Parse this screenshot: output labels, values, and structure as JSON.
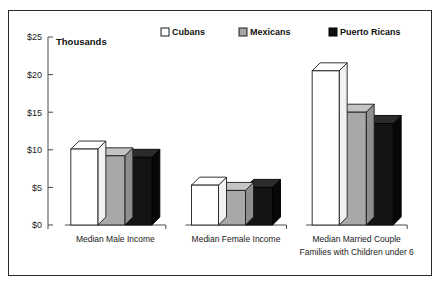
{
  "chart_data": {
    "type": "bar",
    "title": "",
    "subtitle": "",
    "xlabel": "",
    "ylabel": "Thousands",
    "ylim": [
      0,
      25
    ],
    "ytick_values": [
      0,
      5,
      10,
      15,
      20,
      25
    ],
    "ytick_labels": [
      "$0",
      "$5",
      "$10",
      "$15",
      "$20",
      "$25"
    ],
    "grid": false,
    "legend_position": "top",
    "style": "3d-bars",
    "categories": [
      "Median Male Income",
      "Median Female Income",
      "Median Married Couple"
    ],
    "category_sublabels": [
      "",
      "",
      "Families with Children under 6"
    ],
    "series": [
      {
        "name": "Cubans",
        "color": "#ffffff",
        "swatch": "swatch-white",
        "values": [
          10.1,
          5.3,
          20.5
        ]
      },
      {
        "name": "Mexicans",
        "color": "#a8a8a8",
        "swatch": "swatch-gray",
        "values": [
          9.2,
          4.6,
          15.0
        ]
      },
      {
        "name": "Puerto Ricans",
        "color": "#101010",
        "swatch": "swatch-black",
        "values": [
          9.0,
          5.0,
          13.5
        ]
      }
    ]
  },
  "axis": {
    "y_title": "Thousands"
  },
  "legend": {
    "items": [
      {
        "label": "Cubans",
        "swatch_name": "legend-swatch-cubans"
      },
      {
        "label": "Mexicans",
        "swatch_name": "legend-swatch-mexicans"
      },
      {
        "label": "Puerto Ricans",
        "swatch_name": "legend-swatch-puerto-ricans"
      }
    ]
  }
}
